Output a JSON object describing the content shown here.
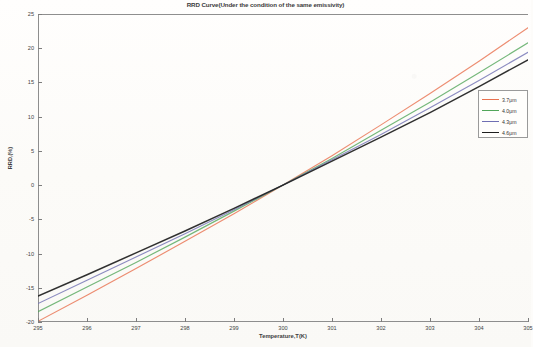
{
  "chart_data": {
    "type": "line",
    "title": "RRD Curve(Under the condition of the same emissivity)",
    "xlabel": "Temperature,T(K)",
    "ylabel": "RRD,(%)",
    "xlim": [
      295,
      305
    ],
    "ylim": [
      -20,
      25
    ],
    "xticks": [
      295,
      296,
      297,
      298,
      299,
      300,
      301,
      302,
      303,
      304,
      305
    ],
    "yticks": [
      -20,
      -15,
      -10,
      -5,
      0,
      5,
      10,
      15,
      20,
      25
    ],
    "grid": false,
    "legend_position": "right",
    "x": [
      295,
      296,
      297,
      298,
      299,
      300,
      301,
      302,
      303,
      304,
      305
    ],
    "series": [
      {
        "name": "3.7μm",
        "color": "#e8714f",
        "values": [
          -19.9,
          -16.1,
          -12.2,
          -8.2,
          -4.2,
          0.0,
          4.3,
          8.8,
          13.4,
          18.1,
          23.0
        ]
      },
      {
        "name": "4.0μm",
        "color": "#52a65a",
        "values": [
          -18.5,
          -14.9,
          -11.3,
          -7.6,
          -3.8,
          0.0,
          3.9,
          8.0,
          12.1,
          16.4,
          20.8
        ]
      },
      {
        "name": "4.3μm",
        "color": "#6f6fb3",
        "values": [
          -17.3,
          -13.9,
          -10.5,
          -7.1,
          -3.6,
          0.0,
          3.7,
          7.4,
          11.3,
          15.3,
          19.4
        ]
      },
      {
        "name": "4.6μm",
        "color": "#1e1e1e",
        "values": [
          -16.2,
          -13.1,
          -9.9,
          -6.7,
          -3.4,
          0.0,
          3.5,
          7.0,
          10.6,
          14.4,
          18.3
        ]
      }
    ]
  },
  "legend": {
    "items": [
      {
        "label": "3.7μm"
      },
      {
        "label": "4.0μm"
      },
      {
        "label": "4.3μm"
      },
      {
        "label": "4.6μm"
      }
    ]
  }
}
